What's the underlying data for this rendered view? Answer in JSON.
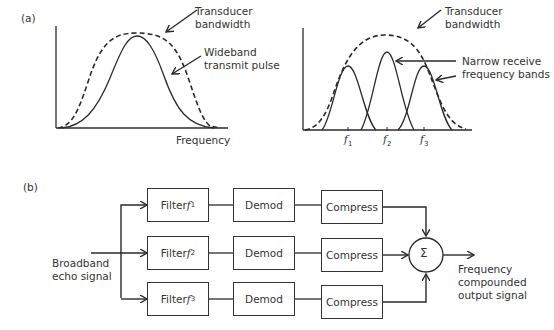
{
  "panel_a": {
    "label": "(a)",
    "left_chart": {
      "x_axis_label": "Frequency",
      "annotations": [
        {
          "id": "transducer",
          "line1": "Transducer",
          "line2": "bandwidth"
        },
        {
          "id": "wideband",
          "line1": "Wideband",
          "line2": "transmit pulse"
        }
      ]
    },
    "right_chart": {
      "annotations": [
        {
          "id": "transducer",
          "line1": "Transducer",
          "line2": "bandwidth"
        },
        {
          "id": "narrow",
          "line1": "Narrow receive",
          "line2": "frequency bands"
        }
      ],
      "ticks": [
        {
          "base": "f",
          "sub": "1"
        },
        {
          "base": "f",
          "sub": "2"
        },
        {
          "base": "f",
          "sub": "3"
        }
      ]
    }
  },
  "panel_b": {
    "label": "(b)",
    "input_label": {
      "line1": "Broadband",
      "line2": "echo signal"
    },
    "output_label": {
      "line1": "Frequency",
      "line2": "compounded",
      "line3": "output signal"
    },
    "sum_symbol": "Σ",
    "rows": [
      {
        "filter": "Filter ",
        "filter_var": "f",
        "filter_sub": "1",
        "demod": "Demod",
        "compress": "Compress"
      },
      {
        "filter": "Filter ",
        "filter_var": "f",
        "filter_sub": "2",
        "demod": "Demod",
        "compress": "Compress"
      },
      {
        "filter": "Filter ",
        "filter_var": "f",
        "filter_sub": "3",
        "demod": "Demod",
        "compress": "Compress"
      }
    ]
  },
  "colors": {
    "stroke": "#2a2a2a",
    "background": "#ffffff"
  }
}
